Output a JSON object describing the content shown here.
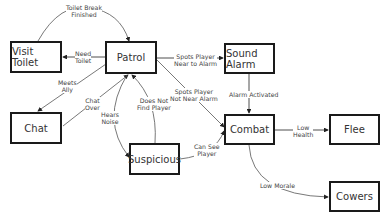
{
  "diagram": {
    "type": "state-machine",
    "states": [
      {
        "id": "visit_toilet",
        "label": "Visit Toilet"
      },
      {
        "id": "patrol",
        "label": "Patrol"
      },
      {
        "id": "sound_alarm",
        "label": "Sound Alarm"
      },
      {
        "id": "chat",
        "label": "Chat"
      },
      {
        "id": "suspicious",
        "label": "Suspicious"
      },
      {
        "id": "combat",
        "label": "Combat"
      },
      {
        "id": "flee",
        "label": "Flee"
      },
      {
        "id": "cowers",
        "label": "Cowers"
      }
    ],
    "transitions": [
      {
        "from": "visit_toilet",
        "to": "patrol",
        "label": "Toilet Break\nFinished"
      },
      {
        "from": "patrol",
        "to": "visit_toilet",
        "label": "Need\nToilet"
      },
      {
        "from": "patrol",
        "to": "chat",
        "label": "Meets\nAlly"
      },
      {
        "from": "chat",
        "to": "patrol",
        "label": "Chat\nOver"
      },
      {
        "from": "patrol",
        "to": "suspicious",
        "label": "Hears\nNoise"
      },
      {
        "from": "suspicious",
        "to": "patrol",
        "label": "Does Not\nFind Player"
      },
      {
        "from": "patrol",
        "to": "sound_alarm",
        "label": "Spots Player\nNear to Alarm"
      },
      {
        "from": "patrol",
        "to": "combat",
        "label": "Spots Player\nNot Near Alarm"
      },
      {
        "from": "sound_alarm",
        "to": "combat",
        "label": "Alarm Activated"
      },
      {
        "from": "suspicious",
        "to": "combat",
        "label": "Can See\nPlayer"
      },
      {
        "from": "combat",
        "to": "flee",
        "label": "Low\nHealth"
      },
      {
        "from": "combat",
        "to": "cowers",
        "label": "Low Morale"
      }
    ]
  }
}
